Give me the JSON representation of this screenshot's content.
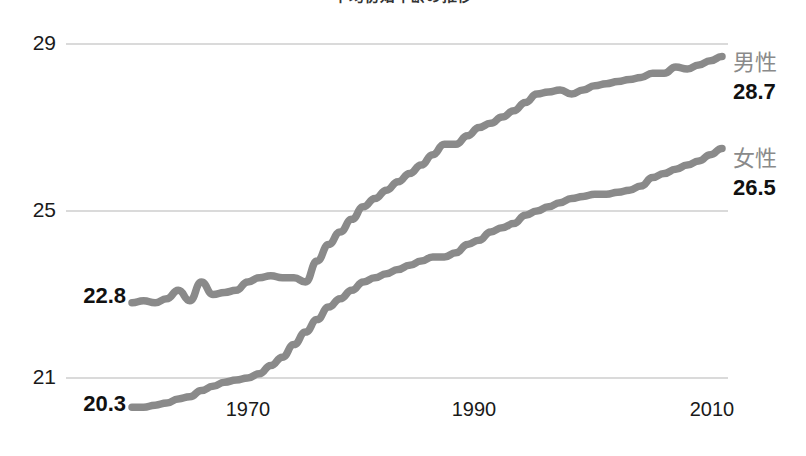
{
  "title": "平均初婚年齢の推移",
  "chart_data": {
    "type": "line",
    "title": "平均初婚年齢の推移",
    "xlabel": "",
    "ylabel": "",
    "xlim": [
      1960,
      2011
    ],
    "ylim": [
      19.6,
      29.4
    ],
    "grid": true,
    "gridlines_y": [
      21,
      25,
      29
    ],
    "legend_position": "right-end-labels",
    "x_ticks": [
      1970,
      1990,
      2010
    ],
    "y_ticks": [
      21,
      25,
      29
    ],
    "x_tick_labels": [
      "1970",
      "1990",
      "2010"
    ],
    "y_tick_labels": [
      "21",
      "25",
      "29"
    ],
    "x": [
      1960,
      1961,
      1962,
      1963,
      1964,
      1965,
      1966,
      1967,
      1968,
      1969,
      1970,
      1971,
      1972,
      1973,
      1974,
      1975,
      1976,
      1977,
      1978,
      1979,
      1980,
      1981,
      1982,
      1983,
      1984,
      1985,
      1986,
      1987,
      1988,
      1989,
      1990,
      1991,
      1992,
      1993,
      1994,
      1995,
      1996,
      1997,
      1998,
      1999,
      2000,
      2001,
      2002,
      2003,
      2004,
      2005,
      2006,
      2007,
      2008,
      2009,
      2010,
      2011
    ],
    "series": [
      {
        "name": "男性",
        "label": "男性",
        "color": "#8a8a8a",
        "start_value": 22.8,
        "end_value": 28.7,
        "values": [
          22.8,
          22.85,
          22.8,
          22.9,
          23.1,
          22.85,
          23.3,
          23.0,
          23.05,
          23.1,
          23.3,
          23.4,
          23.45,
          23.4,
          23.4,
          23.3,
          23.8,
          24.2,
          24.5,
          24.8,
          25.1,
          25.3,
          25.5,
          25.7,
          25.9,
          26.1,
          26.35,
          26.6,
          26.6,
          26.8,
          27.0,
          27.1,
          27.25,
          27.4,
          27.6,
          27.8,
          27.85,
          27.9,
          27.8,
          27.9,
          28.0,
          28.05,
          28.1,
          28.15,
          28.2,
          28.3,
          28.3,
          28.45,
          28.4,
          28.5,
          28.6,
          28.7
        ]
      },
      {
        "name": "女性",
        "label": "女性",
        "color": "#8a8a8a",
        "start_value": 20.3,
        "end_value": 26.5,
        "values": [
          20.3,
          20.3,
          20.35,
          20.4,
          20.5,
          20.55,
          20.7,
          20.8,
          20.9,
          20.95,
          21.0,
          21.1,
          21.3,
          21.5,
          21.8,
          22.1,
          22.4,
          22.7,
          22.9,
          23.1,
          23.3,
          23.4,
          23.5,
          23.6,
          23.7,
          23.8,
          23.9,
          23.9,
          24.0,
          24.2,
          24.3,
          24.5,
          24.6,
          24.7,
          24.9,
          25.0,
          25.1,
          25.2,
          25.3,
          25.35,
          25.4,
          25.4,
          25.45,
          25.5,
          25.6,
          25.8,
          25.9,
          26.0,
          26.1,
          26.2,
          26.35,
          26.5
        ]
      }
    ],
    "annotations": [
      {
        "text": "22.8",
        "series": "男性",
        "position": "start"
      },
      {
        "text": "20.3",
        "series": "女性",
        "position": "start"
      },
      {
        "text": "28.7",
        "series": "男性",
        "position": "end"
      },
      {
        "text": "26.5",
        "series": "女性",
        "position": "end"
      }
    ]
  },
  "axes": {
    "y_ticks": [
      {
        "label": "29",
        "value": 29
      },
      {
        "label": "25",
        "value": 25
      },
      {
        "label": "21",
        "value": 21
      }
    ],
    "x_ticks": [
      {
        "label": "1970",
        "value": 1970
      },
      {
        "label": "1990",
        "value": 1990
      },
      {
        "label": "2010",
        "value": 2010
      }
    ]
  },
  "callouts": {
    "male_name": "男性",
    "male_end_value": "28.7",
    "male_start_value": "22.8",
    "female_name": "女性",
    "female_end_value": "26.5",
    "female_start_value": "20.3"
  },
  "colors": {
    "line": "#8a8a8a",
    "grid": "#b5b5b5",
    "text": "#1a1a1a",
    "series_label": "#8a8a8a",
    "background": "#ffffff"
  }
}
